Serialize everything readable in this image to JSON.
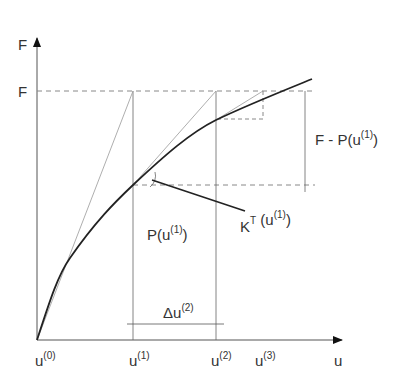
{
  "diagram": {
    "axes": {
      "y_label": "F",
      "x_label": "u"
    },
    "labels": {
      "F_level": "F",
      "residual": "F - P(u",
      "residual_sup": "(1)",
      "residual_close": ")",
      "P_base": "P(u",
      "P_sup": "(1)",
      "P_close": ")",
      "KT_base": "K",
      "KT_sup": "T",
      "KT_arg": " (u",
      "KT_arg_sup": "(1)",
      "KT_close": ")",
      "delta_u": "Δu",
      "delta_u_sup": "(2)"
    },
    "x_ticks": [
      {
        "base": "u",
        "sup": "(0)"
      },
      {
        "base": "u",
        "sup": "(1)"
      },
      {
        "base": "u",
        "sup": "(2)"
      },
      {
        "base": "u",
        "sup": "(3)"
      }
    ],
    "colors": {
      "curve": "#222222",
      "thin": "#555555",
      "tangent": "#999999",
      "dashed": "#888888"
    }
  }
}
